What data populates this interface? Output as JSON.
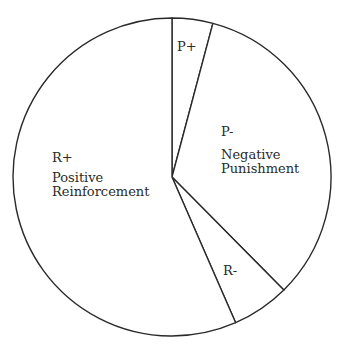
{
  "chart_data": {
    "type": "pie",
    "title": "",
    "start_angle_deg": 0,
    "direction": "clockwise",
    "slices": [
      {
        "key": "p_plus",
        "label": "P+",
        "sublabel": "",
        "percent": 4.1,
        "angle_deg": 14.9
      },
      {
        "key": "p_minus",
        "label": "P-",
        "sublabel": "Negative Punishment",
        "percent": 33.4,
        "angle_deg": 120.4
      },
      {
        "key": "r_minus",
        "label": "R-",
        "sublabel": "",
        "percent": 5.9,
        "angle_deg": 21.1
      },
      {
        "key": "r_plus",
        "label": "R+",
        "sublabel": "Positive Reinforcement",
        "percent": 56.6,
        "angle_deg": 203.6
      }
    ],
    "categories": [
      "P+",
      "P-",
      "R-",
      "R+"
    ],
    "values": [
      4.1,
      33.4,
      5.9,
      56.6
    ],
    "legend": "none",
    "colors": {
      "fill": "#ffffff",
      "stroke": "#2a2a2a",
      "text": "#2a2a2a"
    }
  },
  "labels": {
    "p_plus": {
      "short": "P+"
    },
    "p_minus": {
      "short": "P-",
      "line1": "Negative",
      "line2": "Punishment"
    },
    "r_minus": {
      "short": "R-"
    },
    "r_plus": {
      "short": "R+",
      "line1": "Positive",
      "line2": "Reinforcement"
    }
  }
}
